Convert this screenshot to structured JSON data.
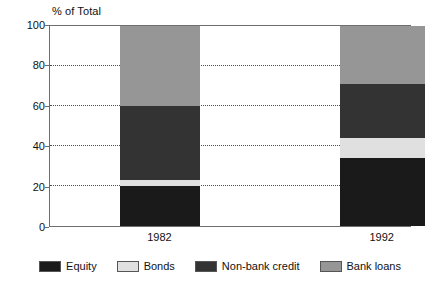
{
  "chart_data": {
    "type": "bar",
    "subtype": "stacked-bar-percent",
    "title": "",
    "axis_title": "% of Total",
    "xlabel": "",
    "ylabel": "% of Total",
    "categories": [
      "1982",
      "1992"
    ],
    "ylim": [
      0,
      100
    ],
    "yticks": [
      0,
      20,
      40,
      60,
      80,
      100
    ],
    "ytick_labels": [
      "0",
      "20",
      "40",
      "60",
      "80",
      "100"
    ],
    "gridlines": [
      20,
      40,
      60,
      80
    ],
    "grid": true,
    "grid_style": "dotted",
    "legend_position": "bottom",
    "stack_order_bottom_to_top": [
      "Equity",
      "Bonds",
      "Non-bank credit",
      "Bank loans"
    ],
    "series": [
      {
        "name": "Equity",
        "color": "#1a1a1a",
        "values": [
          20,
          34
        ],
        "ranges": [
          [
            0,
            20
          ],
          [
            0,
            34
          ]
        ]
      },
      {
        "name": "Bonds",
        "color": "#e0e0e0",
        "values": [
          3,
          10
        ],
        "ranges": [
          [
            20,
            23
          ],
          [
            34,
            44
          ]
        ]
      },
      {
        "name": "Non-bank credit",
        "color": "#333333",
        "values": [
          37,
          27
        ],
        "ranges": [
          [
            23,
            60
          ],
          [
            44,
            71
          ]
        ]
      },
      {
        "name": "Bank loans",
        "color": "#969696",
        "values": [
          40,
          29
        ],
        "ranges": [
          [
            60,
            100
          ],
          [
            71,
            100
          ]
        ]
      }
    ],
    "legend": [
      {
        "label": "Equity",
        "color": "#1a1a1a"
      },
      {
        "label": "Bonds",
        "color": "#e0e0e0"
      },
      {
        "label": "Non-bank credit",
        "color": "#333333"
      },
      {
        "label": "Bank loans",
        "color": "#969696"
      }
    ]
  }
}
